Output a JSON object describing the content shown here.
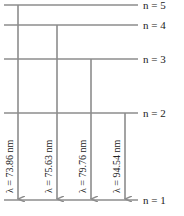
{
  "levels": [
    {
      "n": 5,
      "label": "n = 5",
      "y": 5
    },
    {
      "n": 4,
      "label": "n = 4",
      "y": 25
    },
    {
      "n": 3,
      "label": "n = 3",
      "y": 59
    },
    {
      "n": 2,
      "label": "n = 2",
      "y": 113
    },
    {
      "n": 1,
      "label": "n = 1",
      "y": 200
    }
  ],
  "transitions": [
    {
      "from": 5,
      "to": 1,
      "x": 18,
      "label": "λ = 73.86 nm"
    },
    {
      "from": 4,
      "to": 1,
      "x": 57,
      "label": "λ = 75.63 nm"
    },
    {
      "from": 3,
      "to": 1,
      "x": 91,
      "label": "λ = 79.76 nm"
    },
    {
      "from": 2,
      "to": 1,
      "x": 125,
      "label": "λ = 94.54 nm"
    }
  ],
  "colors": {
    "line": "#8c8c8c",
    "text": "#222222"
  }
}
